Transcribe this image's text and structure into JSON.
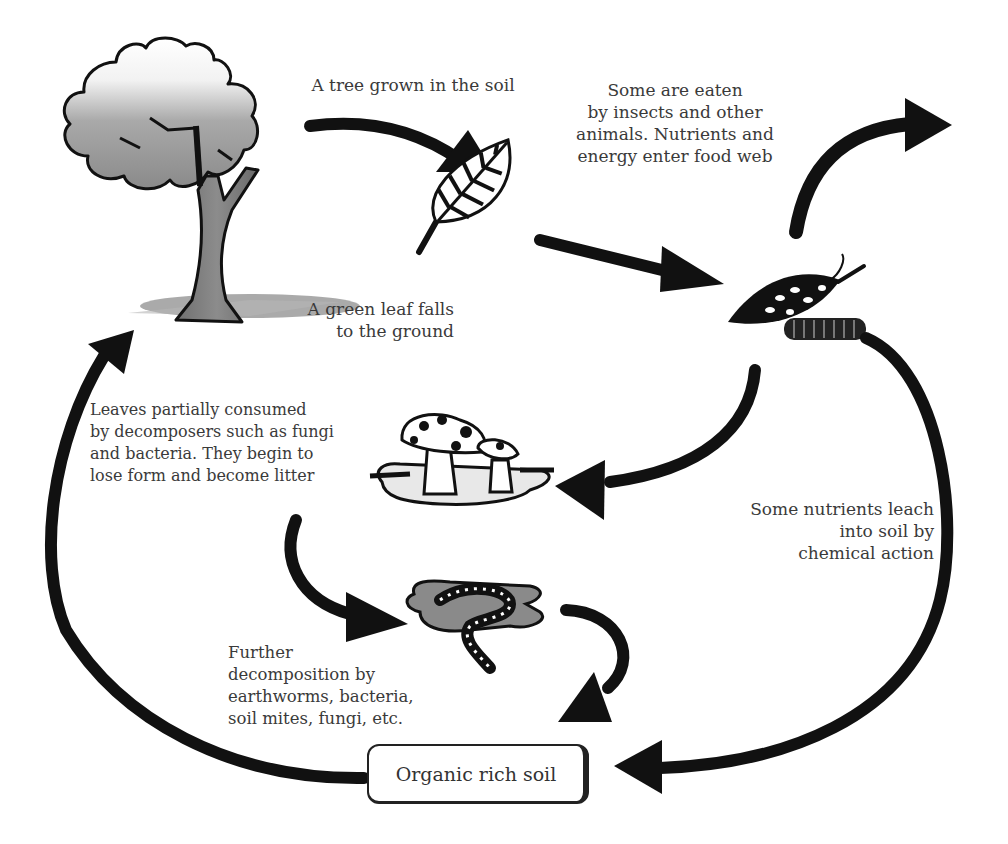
{
  "diagram": {
    "type": "cycle",
    "labels": {
      "tree": "A tree grown in the soil",
      "leaf_falls": "A green leaf falls\nto the ground",
      "eaten": "Some are eaten\nby insects and other\nanimals. Nutrients and\nenergy enter food web",
      "fungi": "Leaves partially consumed\nby decomposers such as fungi\nand bacteria. They begin to\nlose form and become litter",
      "leach": "Some nutrients leach\ninto soil by\nchemical action",
      "worms": "Further\ndecomposition by\nearthworms, bacteria,\nsoil mites, fungi, etc.",
      "soil": "Organic rich soil"
    },
    "nodes": [
      {
        "id": "tree",
        "icon": "tree-icon"
      },
      {
        "id": "green-leaf",
        "icon": "leaf-icon"
      },
      {
        "id": "eaten-leaf",
        "icon": "caterpillar-leaf-icon"
      },
      {
        "id": "fungi-litter",
        "icon": "mushroom-icon"
      },
      {
        "id": "earthworm",
        "icon": "earthworm-icon"
      },
      {
        "id": "soil",
        "icon": "soil-box"
      }
    ],
    "edges": [
      {
        "from": "tree",
        "to": "green-leaf"
      },
      {
        "from": "green-leaf",
        "to": "eaten-leaf"
      },
      {
        "from": "eaten-leaf",
        "to": "food-web"
      },
      {
        "from": "eaten-leaf",
        "to": "fungi-litter"
      },
      {
        "from": "eaten-leaf",
        "to": "soil"
      },
      {
        "from": "fungi-litter",
        "to": "earthworm"
      },
      {
        "from": "earthworm",
        "to": "soil"
      },
      {
        "from": "soil",
        "to": "tree"
      }
    ],
    "colors": {
      "arrow": "#111111",
      "text": "#3a3a3a",
      "shadow": "#9a9a9a"
    }
  }
}
